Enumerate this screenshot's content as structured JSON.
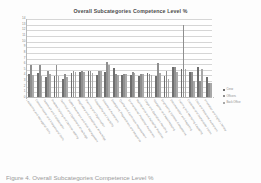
{
  "figure": {
    "caption": "Figure 4. Overall Subcategories Competence Level %"
  },
  "legend": {
    "position": "right",
    "items": [
      {
        "label": "Crew",
        "color": "#6e6e6e"
      },
      {
        "label": "Officers",
        "color": "#8f8f8f"
      },
      {
        "label": "Back Office",
        "color": "#a8a8a8"
      }
    ]
  },
  "chart_data": {
    "type": "bar",
    "title": "Overall Subcategories Competence Level %",
    "xlabel": "",
    "ylabel": "",
    "ylim": [
      0,
      14
    ],
    "yticks": [
      0,
      1,
      2,
      3,
      4,
      5,
      6,
      7,
      8,
      9,
      10,
      11,
      12,
      13,
      14
    ],
    "ytick_labels": [
      "0",
      "1",
      "2",
      "3",
      "4",
      "5",
      "6",
      "7",
      "8",
      "9",
      "10",
      "11",
      "12",
      "13",
      "14"
    ],
    "grid": true,
    "legend_position": "right",
    "categories": [
      "Leadership and Managerial Skills",
      "Communication and Interpersonal Skills",
      "Teamwork and Collaboration",
      "Problem Solving and Decision Making",
      "Technical and Operational Knowledge",
      "Safety Awareness and Risk Management",
      "Regulatory and Compliance Knowledge",
      "Planning and Organisation",
      "Adaptability and Flexibility",
      "Situational Awareness",
      "Emergency Preparedness and Response",
      "Quality and Continuous Improvement",
      "Environmental Protection Awareness",
      "Maintenance and Reliability Practices",
      "Cargo and Operations Handling",
      "Navigation and Watchkeeping",
      "Engineering Systems Competence",
      "Documentation and Reporting",
      "Training and Mentoring Capability",
      "Customer and Stakeholder Focus",
      "Cost and Resource Awareness",
      "Innovation and Digital Literacy"
    ],
    "series": [
      {
        "name": "Crew",
        "color": "#6e6e6e",
        "values": [
          4.1,
          4.3,
          3.6,
          3.8,
          3.2,
          4.3,
          4.5,
          4.6,
          3.9,
          4.5,
          5.1,
          3.9,
          3.9,
          3.8,
          4.3,
          3.8,
          3.8,
          5.3,
          5.0,
          4.5,
          5.3,
          3.5
        ]
      },
      {
        "name": "Officers",
        "color": "#8f8f8f",
        "values": [
          5.6,
          5.6,
          4.6,
          5.6,
          4.0,
          4.6,
          4.6,
          4.6,
          4.6,
          6.2,
          4.0,
          4.0,
          4.4,
          4.0,
          4.1,
          6.1,
          4.6,
          5.3,
          12.7,
          4.5,
          2.9,
          2.4
        ]
      },
      {
        "name": "Back Office",
        "color": "#a8a8a8",
        "values": [
          3.9,
          3.7,
          4.1,
          3.8,
          3.6,
          4.5,
          4.4,
          4.2,
          4.6,
          5.6,
          3.9,
          4.1,
          4.3,
          4.1,
          3.9,
          4.2,
          3.2,
          4.4,
          5.0,
          2.9,
          4.9,
          2.5
        ]
      }
    ]
  }
}
